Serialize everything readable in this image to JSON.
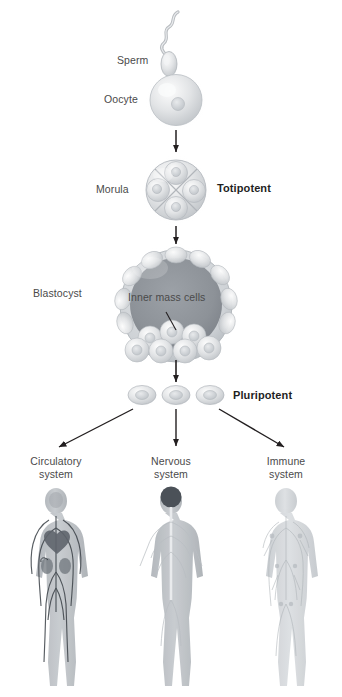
{
  "diagram": {
    "background": "#ffffff",
    "label_color": "#4a4a4a",
    "emphasis_color": "#1f1f1f",
    "arrow_color": "#231f20"
  },
  "labels": {
    "sperm": "Sperm",
    "oocyte": "Oocyte",
    "morula": "Morula",
    "totipotent": "Totipotent",
    "blastocyst": "Blastocyst",
    "inner_mass_cells": "Inner mass cells",
    "pluripotent": "Pluripotent",
    "circulatory_line1": "Circulatory",
    "circulatory_line2": "system",
    "nervous_line1": "Nervous",
    "nervous_line2": "system",
    "immune_line1": "Immune",
    "immune_line2": "system"
  },
  "stages": [
    {
      "name": "fertilization",
      "cells": 1,
      "potency": ""
    },
    {
      "name": "morula",
      "cells": 4,
      "potency": "Totipotent"
    },
    {
      "name": "blastocyst",
      "cells": 0,
      "potency": ""
    },
    {
      "name": "stem-cells",
      "cells": 3,
      "potency": "Pluripotent"
    }
  ],
  "outcomes": [
    {
      "name": "circulatory-system",
      "label": "Circulatory system",
      "tint": "#9a9fa6"
    },
    {
      "name": "nervous-system",
      "label": "Nervous system",
      "tint": "#a7acb2"
    },
    {
      "name": "immune-system",
      "label": "Immune system",
      "tint": "#c2c6ca"
    }
  ]
}
